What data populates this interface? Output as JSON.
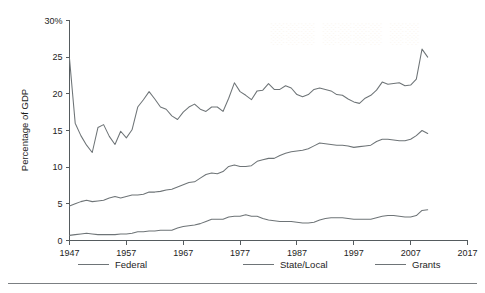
{
  "chart_data": {
    "type": "line",
    "title": "",
    "xlabel": "",
    "ylabel": "Percentage of GDP",
    "xlim": [
      1947,
      2017
    ],
    "ylim": [
      0,
      30
    ],
    "grid": false,
    "legend_position": "bottom",
    "x_ticks": [
      "1947",
      "1957",
      "1967",
      "1977",
      "1987",
      "1997",
      "2007",
      "2017"
    ],
    "x_tick_values": [
      1947,
      1957,
      1967,
      1977,
      1987,
      1997,
      2007,
      2017
    ],
    "y_ticks": [
      "0",
      "5",
      "10",
      "15",
      "20",
      "25",
      "30%"
    ],
    "y_tick_values": [
      0,
      5,
      10,
      15,
      20,
      25,
      30
    ],
    "x": [
      1947,
      1948,
      1949,
      1950,
      1951,
      1952,
      1953,
      1954,
      1955,
      1956,
      1957,
      1958,
      1959,
      1960,
      1961,
      1962,
      1963,
      1964,
      1965,
      1966,
      1967,
      1968,
      1969,
      1970,
      1971,
      1972,
      1973,
      1974,
      1975,
      1976,
      1977,
      1978,
      1979,
      1980,
      1981,
      1982,
      1983,
      1984,
      1985,
      1986,
      1987,
      1988,
      1989,
      1990,
      1991,
      1992,
      1993,
      1994,
      1995,
      1996,
      1997,
      1998,
      1999,
      2000,
      2001,
      2002,
      2003,
      2004,
      2005,
      2006,
      2007,
      2008,
      2009,
      2010
    ],
    "series": [
      {
        "name": "Federal",
        "color": "#6e7477",
        "values": [
          24.8,
          16.0,
          14.3,
          13.0,
          12.0,
          15.4,
          15.8,
          14.2,
          13.1,
          14.9,
          14.0,
          15.1,
          18.2,
          19.2,
          20.3,
          19.3,
          18.2,
          17.9,
          17.0,
          16.5,
          17.5,
          18.2,
          18.6,
          17.9,
          17.6,
          18.2,
          18.2,
          17.6,
          19.4,
          21.5,
          20.3,
          19.8,
          19.2,
          20.4,
          20.5,
          21.4,
          20.6,
          20.6,
          21.1,
          20.8,
          19.9,
          19.6,
          19.9,
          20.6,
          20.8,
          20.6,
          20.4,
          19.9,
          19.8,
          19.3,
          18.9,
          18.7,
          19.4,
          19.8,
          20.5,
          21.6,
          21.3,
          21.4,
          21.5,
          21.1,
          21.2,
          22.0,
          26.1,
          25.0
        ]
      },
      {
        "name": "State/Local",
        "color": "#6e7477",
        "values": [
          4.7,
          5.0,
          5.3,
          5.5,
          5.3,
          5.4,
          5.5,
          5.8,
          6.0,
          5.8,
          6.0,
          6.2,
          6.2,
          6.3,
          6.6,
          6.6,
          6.7,
          6.9,
          7.0,
          7.3,
          7.6,
          7.9,
          8.0,
          8.5,
          9.0,
          9.2,
          9.1,
          9.4,
          10.1,
          10.3,
          10.1,
          10.1,
          10.2,
          10.8,
          11.0,
          11.2,
          11.2,
          11.6,
          11.9,
          12.1,
          12.2,
          12.3,
          12.5,
          12.9,
          13.3,
          13.2,
          13.1,
          13.0,
          13.0,
          12.9,
          12.7,
          12.8,
          12.9,
          13.0,
          13.5,
          13.8,
          13.8,
          13.7,
          13.6,
          13.6,
          13.8,
          14.3,
          15.0,
          14.6
        ]
      },
      {
        "name": "Grants",
        "color": "#6e7477",
        "values": [
          0.7,
          0.8,
          0.9,
          1.0,
          0.9,
          0.8,
          0.8,
          0.8,
          0.8,
          0.9,
          0.9,
          1.0,
          1.2,
          1.2,
          1.3,
          1.3,
          1.4,
          1.4,
          1.4,
          1.7,
          1.9,
          2.0,
          2.1,
          2.3,
          2.6,
          2.9,
          2.9,
          2.9,
          3.2,
          3.3,
          3.3,
          3.5,
          3.3,
          3.3,
          3.0,
          2.8,
          2.7,
          2.6,
          2.6,
          2.6,
          2.5,
          2.4,
          2.4,
          2.5,
          2.8,
          3.0,
          3.1,
          3.1,
          3.1,
          3.0,
          2.9,
          2.9,
          2.9,
          2.9,
          3.1,
          3.3,
          3.4,
          3.4,
          3.3,
          3.2,
          3.2,
          3.4,
          4.1,
          4.2
        ]
      }
    ]
  },
  "legend": {
    "items": [
      {
        "label": "Federal"
      },
      {
        "label": "State/Local"
      },
      {
        "label": "Grants"
      }
    ]
  },
  "axis": {
    "y_title": "Percentage of GDP"
  },
  "watermark": {
    "text": "W"
  }
}
